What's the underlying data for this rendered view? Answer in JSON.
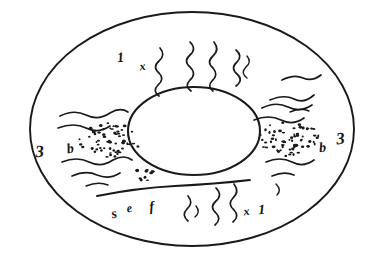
{
  "figure": {
    "kind": "hand-drawn-annular-cross-section",
    "caption": "",
    "ink_color": "#1a1a1a",
    "background_color": "#ffffff",
    "canvas": {
      "width": 380,
      "height": 262
    }
  },
  "structures": {
    "outer_boundary": {
      "name": "outer-ellipse",
      "cx": 192,
      "cy": 129,
      "rx": 162,
      "ry": 117
    },
    "inner_boundary": {
      "name": "inner-ellipse",
      "cx": 194,
      "cy": 131,
      "rx": 66,
      "ry": 44
    },
    "septum_line": {
      "name": "diagonal-septum",
      "x1": 97,
      "y1": 196,
      "x2": 250,
      "y2": 180
    },
    "stipple_patches": [
      {
        "name": "left-stipple-patch",
        "cx": 110,
        "cy": 140,
        "rx": 32,
        "ry": 17,
        "count": 62
      },
      {
        "name": "right-stipple-patch",
        "cx": 288,
        "cy": 139,
        "rx": 32,
        "ry": 17,
        "count": 62
      },
      {
        "name": "bottom-stipple-patch",
        "cx": 143,
        "cy": 175,
        "rx": 13,
        "ry": 7,
        "count": 12
      }
    ]
  },
  "labels": [
    {
      "id": "top-left-numeral",
      "text": "1",
      "x": 121,
      "y": 62,
      "size": "label-md",
      "rotation": -6
    },
    {
      "id": "top-left-times",
      "text": "x",
      "x": 143,
      "y": 70,
      "size": "label-sm",
      "rotation": -8
    },
    {
      "id": "left-numeral",
      "text": "3",
      "x": 40,
      "y": 157,
      "size": "label-lg",
      "rotation": -4
    },
    {
      "id": "left-letter-b",
      "text": "b",
      "x": 71,
      "y": 153,
      "size": "label-md",
      "rotation": -10
    },
    {
      "id": "right-letter-b",
      "text": "b",
      "x": 323,
      "y": 152,
      "size": "label-md",
      "rotation": -6
    },
    {
      "id": "right-numeral",
      "text": "3",
      "x": 341,
      "y": 144,
      "size": "label-lg",
      "rotation": -6
    },
    {
      "id": "bottom-letter-s",
      "text": "s",
      "x": 115,
      "y": 218,
      "size": "label-md",
      "rotation": -12
    },
    {
      "id": "bottom-letter-e",
      "text": "e",
      "x": 130,
      "y": 212,
      "size": "label-sm",
      "rotation": -10
    },
    {
      "id": "bottom-letter-f",
      "text": "f",
      "x": 152,
      "y": 211,
      "size": "label-md",
      "rotation": -6
    },
    {
      "id": "bottom-right-times",
      "text": "x",
      "x": 247,
      "y": 215,
      "size": "label-sm",
      "rotation": -8
    },
    {
      "id": "bottom-right-one",
      "text": "1",
      "x": 262,
      "y": 214,
      "size": "label-md",
      "rotation": -4
    }
  ],
  "fiber_groups": [
    {
      "name": "top-radiating-fibers",
      "orientation": "vertical",
      "strokes": [
        "M 160 48 q 6 7 -1 13 q -7 6 0 12 q 6 6 -1 12 q -6 6 1 11",
        "M 190 42 q 7 7 0 13 q -7 6 0 12 q 7 7 0 13 q -6 6 1 11",
        "M 214 42 q 6 8 -1 14 q -7 6 0 12 q 6 7 -1 13 q -5 5 1 10",
        "M 236 50 q 7 6 1 12 q -7 6 0 12 q 7 6 -1 12",
        "M 247 56 q 5 6 -1 11 q -6 6 1 11"
      ]
    },
    {
      "name": "top-right-oblique-fibers",
      "orientation": "oblique",
      "strokes": [
        "M 282 80 q 12 -6 21 -2 q 9 4 18 -3",
        "M 270 100 q 14 -6 24 -1 q 10 5 20 -4",
        "M 290 112 q 11 -5 19 -1"
      ]
    },
    {
      "name": "left-horizontal-fibers",
      "orientation": "horizontal",
      "strokes": [
        "M 60 116 q 14 -7 26 -1 q 12 6 24 -2 q 10 -6 18 -1",
        "M 58 128 q 16 -6 28 0 q 12 6 24 -2",
        "M 62 162 q 15 -6 27 0 q 12 6 24 -2 q 11 -6 19 0",
        "M 72 176 q 14 -6 25 -1 q 12 5 23 -2",
        "M 86 186 q 12 -5 22 -1"
      ]
    },
    {
      "name": "right-horizontal-fibers",
      "orientation": "horizontal",
      "strokes": [
        "M 262 108 q 14 -7 26 -1 q 12 6 24 -2",
        "M 254 120 q 15 -6 27 0 q 12 6 23 -2",
        "M 266 162 q 14 -6 26 0 q 11 6 22 -2",
        "M 272 176 q 12 -5 22 -1",
        "M 276 184 q 6 6 1 11"
      ]
    },
    {
      "name": "bottom-radiating-fibers",
      "orientation": "vertical",
      "strokes": [
        "M 188 196 q 6 7 -1 13 q -6 6 1 12",
        "M 216 188 q 7 7 0 13 q -7 6 0 12 q 6 6 -1 12",
        "M 234 184 q 6 8 -1 14 q -6 6 1 12 q 6 6 -1 12",
        "M 196 206 q 5 6 -1 11"
      ]
    }
  ]
}
